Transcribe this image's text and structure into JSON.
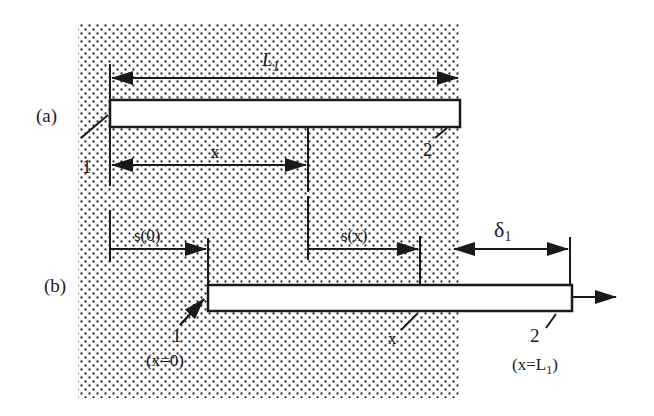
{
  "figure": {
    "panel_a": {
      "label": "(a)",
      "length_label": "L",
      "length_subscript": "1",
      "position_label": "x",
      "end_1_label": "1",
      "end_2_label": "2"
    },
    "panel_b": {
      "label": "(b)",
      "displacement_0_label": "s(0)",
      "displacement_x_label": "s(x)",
      "delta_label": "δ",
      "delta_subscript": "1",
      "end_1_label": "1",
      "end_1_position": "(x=0)",
      "point_label": "x",
      "end_2_label": "2",
      "end_2_position_prefix": "(x=L",
      "end_2_position_subscript": "1",
      "end_2_position_suffix": ")"
    },
    "colors": {
      "ink": "#1a1a1a",
      "stipple": "#2a2a2a",
      "background": "#ffffff",
      "bar_fill": "#ffffff"
    }
  }
}
